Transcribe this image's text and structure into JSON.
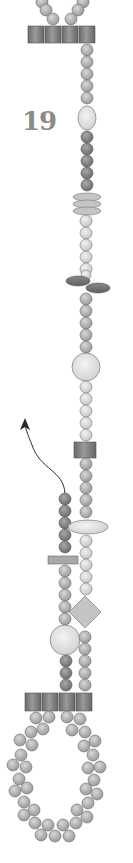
{
  "diagram": {
    "step_number": "19",
    "colors": {
      "seed_bead": "#b8b8b8",
      "seed_bead_light": "#dcdcdc",
      "seed_bead_dark": "#8e8e8e",
      "tube_bead": "#7a7a7a",
      "oval_light": "#e4e4e4",
      "rondelle": "#bdbdbd",
      "dagger_bead": "#7c7c7c",
      "diamond_bead": "#c4c4c4",
      "bar_bead": "#a8a8a8",
      "outline": "#6a6a6a",
      "arrow": "#2a2a2a",
      "label": "#8a8a8a"
    },
    "elements": [
      "top loop beads",
      "four tube beads (top)",
      "seed bead strand",
      "light oval bead",
      "dark seed beads",
      "three rondelle discs",
      "light seed beads",
      "two dagger beads",
      "large round bead",
      "tube bead",
      "threading arrow",
      "horizontal oval bead",
      "bar bead",
      "diamond bead",
      "large round bead (left strand)",
      "four tube beads (bottom)",
      "bottom loop of paired seed beads"
    ]
  }
}
